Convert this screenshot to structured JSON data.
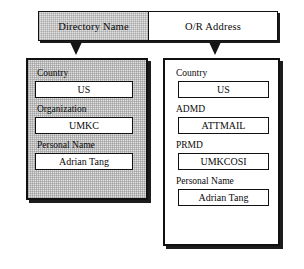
{
  "figure": {
    "header": {
      "left_cell_label": "Directory  Name",
      "right_cell_label": "O/R Address"
    },
    "arrows": {
      "left_arrow_name": "down-arrow-icon",
      "right_arrow_name": "down-arrow-icon"
    },
    "panels": [
      {
        "id": "directory-name-panel",
        "style": "shaded",
        "attributes": [
          {
            "label": "Country",
            "value": "US"
          },
          {
            "label": "Organization",
            "value": "UMKC"
          },
          {
            "label": "Personal Name",
            "value": "Adrian Tang"
          }
        ]
      },
      {
        "id": "or-address-panel",
        "style": "plain",
        "attributes": [
          {
            "label": "Country",
            "value": "US"
          },
          {
            "label": "ADMD",
            "value": "ATTMAIL"
          },
          {
            "label": "PRMD",
            "value": "UMKCOSI"
          },
          {
            "label": "Personal Name",
            "value": "Adrian Tang"
          }
        ]
      }
    ]
  },
  "colors": {
    "ink": "#101010",
    "shade": "#e0e0e0",
    "paper": "#ffffff"
  }
}
